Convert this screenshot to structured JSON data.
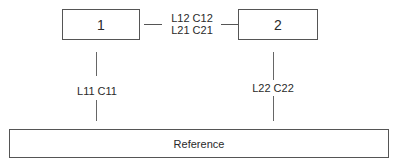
{
  "diagram": {
    "nodes": [
      {
        "id": "node-1",
        "label": "1"
      },
      {
        "id": "node-2",
        "label": "2"
      },
      {
        "id": "reference",
        "label": "Reference"
      }
    ],
    "edges": [
      {
        "from": "1",
        "to": "2",
        "label_line1": "L12  C12",
        "label_line2": "L21 C21"
      },
      {
        "from": "1",
        "to": "Reference",
        "label": "L11  C11"
      },
      {
        "from": "2",
        "to": "Reference",
        "label": "L22  C22"
      }
    ],
    "colors": {
      "line": "#555555",
      "text": "#2a2a2a",
      "background": "#ffffff"
    }
  }
}
